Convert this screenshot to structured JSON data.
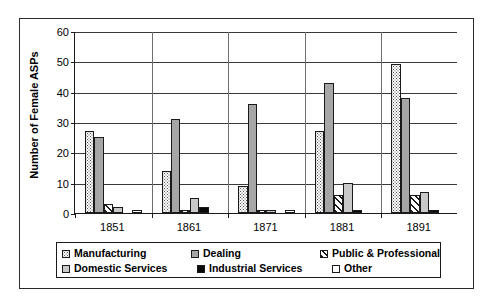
{
  "chart_data": {
    "type": "bar",
    "title": "",
    "xlabel": "",
    "ylabel": "Number of Female ASPs",
    "ylim": [
      0,
      60
    ],
    "yticks": [
      0,
      10,
      20,
      30,
      40,
      50,
      60
    ],
    "grid": true,
    "legend_position": "bottom",
    "categories": [
      "1851",
      "1861",
      "1871",
      "1881",
      "1891"
    ],
    "series": [
      {
        "name": "Manufacturing",
        "pattern": "dotted",
        "color": "#ffffff",
        "values": [
          27,
          14,
          9,
          27,
          49
        ]
      },
      {
        "name": "Dealing",
        "pattern": "solid-gray",
        "color": "#a6a6a6",
        "values": [
          25,
          31,
          36,
          43,
          38
        ]
      },
      {
        "name": "Public & Professional",
        "pattern": "diagonal-hatch",
        "color": "#ffffff",
        "values": [
          3,
          1,
          1,
          6,
          6
        ]
      },
      {
        "name": "Domestic Services",
        "pattern": "light-gray",
        "color": "#c9c9c9",
        "values": [
          2,
          5,
          1,
          10,
          7
        ]
      },
      {
        "name": "Industrial Services",
        "pattern": "solid-black",
        "color": "#0a0a0a",
        "values": [
          0,
          2,
          0,
          1,
          1
        ]
      },
      {
        "name": "Other",
        "pattern": "white",
        "color": "#fdfdfd",
        "values": [
          1,
          0,
          1,
          0,
          0
        ]
      }
    ]
  },
  "legend": {
    "rows": [
      [
        {
          "label": "Manufacturing",
          "swatch": "dotted"
        },
        {
          "label": "Dealing",
          "swatch": "solid-gray"
        },
        {
          "label": "Public & Professional",
          "swatch": "diagonal-hatch"
        }
      ],
      [
        {
          "label": "Domestic Services",
          "swatch": "light-gray"
        },
        {
          "label": "Industrial Services",
          "swatch": "solid-black"
        },
        {
          "label": "Other",
          "swatch": "white"
        }
      ]
    ]
  }
}
